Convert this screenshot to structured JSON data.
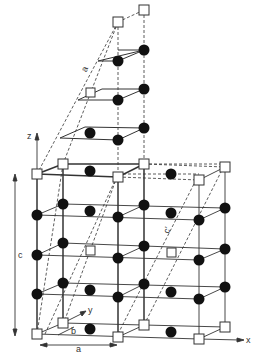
{
  "figure": {
    "type": "crystal-lattice-diagram",
    "colors": {
      "line": "#333333",
      "atom_filled": "#111111",
      "atom_open_fill": "#ffffff",
      "background": "#ffffff"
    }
  },
  "labels": {
    "axis_x": "x",
    "axis_y": "y",
    "axis_z": "z",
    "lattice_a_bottom": "a",
    "lattice_b": "b",
    "lattice_c": "c",
    "lattice_c_prime": "c'",
    "lattice_a_oblique": "a"
  },
  "legend": {
    "open_square": "site type A (open square)",
    "filled_circle": "site type B (filled circle)"
  }
}
